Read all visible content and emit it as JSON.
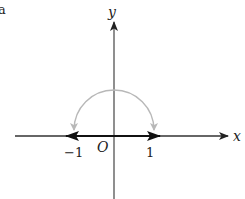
{
  "figure": {
    "corner_fragment": "a",
    "axes": {
      "x_label": "x",
      "y_label": "y",
      "origin_label": "O"
    },
    "tick_labels": {
      "neg_one": "−1",
      "pos_one": "1"
    },
    "colors": {
      "axis": "#333333",
      "segment": "#111111",
      "arc": "#b8b8b8",
      "background": "#ffffff"
    }
  }
}
